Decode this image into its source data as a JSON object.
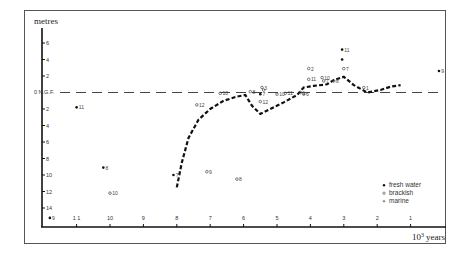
{
  "chart_data": {
    "type": "scatter",
    "title": "",
    "ylabel": "metres",
    "xlabel": "10^3 years",
    "xlabel_base": "10",
    "xlabel_exp": "3",
    "xlabel_unit": "years",
    "reference_line_label": "0 N.G.F.",
    "reference_line_value": 0,
    "xlim": [
      12,
      0
    ],
    "ylim": [
      -16.2,
      8
    ],
    "x_ticks": [
      11,
      10,
      9,
      8,
      7,
      6,
      5,
      4,
      3,
      2,
      1
    ],
    "x_tick_labels": [
      "1 1",
      "10",
      "9",
      "8",
      "7",
      "6",
      "5",
      "4",
      "3",
      "2",
      "1"
    ],
    "y_ticks": [
      6,
      4,
      2,
      -2,
      -4,
      -6,
      -8,
      -10,
      -12,
      -14
    ],
    "y_tick_labels": [
      "6",
      "4",
      "2",
      "2",
      "4",
      "6",
      "8",
      "10",
      "12",
      "14"
    ],
    "grid": false,
    "legend_position": "lower right",
    "legend": [
      {
        "label": "fresh water",
        "marker": "filled-circle"
      },
      {
        "label": "brackish",
        "marker": "open-circle"
      },
      {
        "label": "marine",
        "marker": "cross"
      }
    ],
    "series": [
      {
        "name": "fresh water",
        "marker": "filled-circle",
        "points": [
          {
            "x": 11.8,
            "y": -15.2,
            "label": "9"
          },
          {
            "x": 11.0,
            "y": -1.8,
            "label": "11"
          },
          {
            "x": 10.2,
            "y": -9.1,
            "label": "8"
          },
          {
            "x": 8.1,
            "y": -10.0,
            "label": "7"
          },
          {
            "x": 5.5,
            "y": -0.2,
            "label": "7"
          },
          {
            "x": 3.05,
            "y": 5.2,
            "label": "11"
          },
          {
            "x": 3.05,
            "y": 4.0,
            "label": ""
          },
          {
            "x": 0.15,
            "y": 2.6,
            "label": "9"
          }
        ]
      },
      {
        "name": "brackish",
        "marker": "open-circle",
        "points": [
          {
            "x": 10.0,
            "y": -12.2,
            "label": "10"
          },
          {
            "x": 7.1,
            "y": -9.6,
            "label": "9"
          },
          {
            "x": 6.2,
            "y": -10.5,
            "label": "8"
          },
          {
            "x": 7.4,
            "y": -1.5,
            "label": "12"
          },
          {
            "x": 6.7,
            "y": -0.1,
            "label": "10"
          },
          {
            "x": 5.8,
            "y": 0.1,
            "label": "8"
          },
          {
            "x": 5.5,
            "y": -1.1,
            "label": "12"
          },
          {
            "x": 5.45,
            "y": 0.6,
            "label": "3"
          },
          {
            "x": 5.4,
            "y": 0.3,
            "label": ""
          },
          {
            "x": 5.0,
            "y": -0.2,
            "label": "10"
          },
          {
            "x": 4.75,
            "y": -0.1,
            "label": "11"
          },
          {
            "x": 4.3,
            "y": 0.0,
            "label": "1"
          },
          {
            "x": 4.2,
            "y": -0.2,
            "label": "6"
          },
          {
            "x": 4.05,
            "y": 2.9,
            "label": "2"
          },
          {
            "x": 4.05,
            "y": 1.6,
            "label": "11"
          },
          {
            "x": 3.65,
            "y": 1.8,
            "label": "10"
          },
          {
            "x": 3.6,
            "y": 1.4,
            "label": "7"
          },
          {
            "x": 3.3,
            "y": 1.4,
            "label": "8"
          },
          {
            "x": 3.0,
            "y": 2.9,
            "label": "7"
          },
          {
            "x": 2.4,
            "y": 0.6,
            "label": "1"
          }
        ]
      },
      {
        "name": "marine",
        "marker": "cross",
        "points": []
      }
    ],
    "curve": {
      "name": "sea-level curve",
      "style": "dashed-thick",
      "points": [
        [
          8.0,
          -11.5
        ],
        [
          7.85,
          -8.5
        ],
        [
          7.65,
          -5.5
        ],
        [
          7.35,
          -3.3
        ],
        [
          7.0,
          -2.0
        ],
        [
          6.6,
          -1.0
        ],
        [
          6.2,
          -0.5
        ],
        [
          5.95,
          -0.3
        ],
        [
          5.75,
          -1.6
        ],
        [
          5.5,
          -2.6
        ],
        [
          5.2,
          -2.0
        ],
        [
          4.8,
          -1.2
        ],
        [
          4.4,
          -0.3
        ],
        [
          4.2,
          0.6
        ],
        [
          3.9,
          0.8
        ],
        [
          3.5,
          1.0
        ],
        [
          3.3,
          1.5
        ],
        [
          3.0,
          1.9
        ],
        [
          2.7,
          0.9
        ],
        [
          2.3,
          0.0
        ],
        [
          1.9,
          0.3
        ],
        [
          1.6,
          0.7
        ],
        [
          1.3,
          0.9
        ]
      ]
    }
  }
}
